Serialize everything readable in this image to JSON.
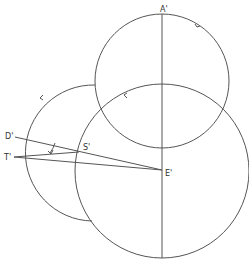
{
  "diagram": {
    "labels": {
      "A": "A'",
      "D": "D'",
      "T": "T'",
      "S": "S'",
      "E": "E'"
    },
    "points": {
      "A": [
        162,
        14
      ],
      "D": [
        15,
        137
      ],
      "T": [
        14,
        157
      ],
      "S": [
        79,
        152
      ],
      "E": [
        162,
        170
      ]
    },
    "circles": [
      {
        "name": "top-circle",
        "cx": 162,
        "cy": 81,
        "r": 67
      },
      {
        "name": "large-circle",
        "cx": 162,
        "cy": 171,
        "r": 87
      },
      {
        "name": "left-arc",
        "cx": 80,
        "cy": 153,
        "r": 68
      }
    ],
    "angle_mark": "small arc between D'S' and T'S' near S'",
    "stroke_color": "#555555"
  }
}
